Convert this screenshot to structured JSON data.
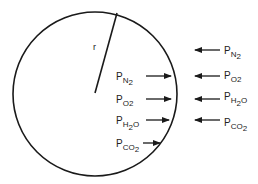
{
  "diagram": {
    "radius_label": "r",
    "inside_labels": [
      {
        "main": "P",
        "sub": "N",
        "sub2": "2"
      },
      {
        "main": "P",
        "sub": "O",
        "sub2": "2"
      },
      {
        "main": "P",
        "sub": "H",
        "sub2": "2",
        "tail": "O"
      },
      {
        "main": "P",
        "sub": "CO",
        "sub2": "2"
      }
    ],
    "outside_labels": [
      {
        "main": "P",
        "sub": "N",
        "sub2": "2"
      },
      {
        "main": "P",
        "sub": "O",
        "sub2": "2"
      },
      {
        "main": "P",
        "sub": "H",
        "sub2": "2",
        "tail": "O"
      },
      {
        "main": "P",
        "sub": "CO",
        "sub2": "2"
      }
    ],
    "stroke_color": "#1a1a1a",
    "background": "#ffffff"
  }
}
